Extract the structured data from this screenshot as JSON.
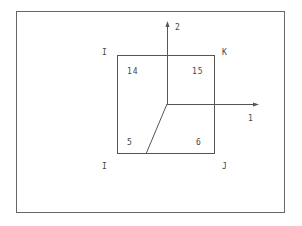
{
  "diagram": {
    "axes": {
      "vertical_label": "2",
      "horizontal_label": "1"
    },
    "corner_labels": {
      "top_left": "I",
      "top_right": "K",
      "bottom_left": "I",
      "bottom_right": "J"
    },
    "quadrant_numbers": {
      "top_left": "14",
      "top_right": "15",
      "bottom_left": "5",
      "bottom_right": "6"
    },
    "colors": {
      "line": "#555555",
      "frame": "#666666"
    }
  }
}
